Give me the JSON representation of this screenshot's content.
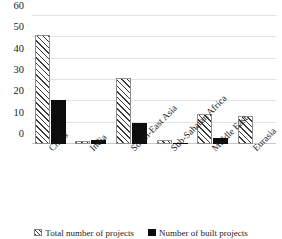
{
  "chart_data": {
    "type": "bar",
    "title": "",
    "subtitle": "",
    "xlabel": "",
    "ylabel": "",
    "ylim": [
      0,
      60
    ],
    "yticks": [
      0,
      10,
      20,
      30,
      40,
      50,
      60
    ],
    "grid": true,
    "legend_position": "bottom",
    "categories": [
      "China",
      "India",
      "South-East Asia",
      "Sub-Saharan Africa",
      "Middle East",
      "Eurasia"
    ],
    "series": [
      {
        "name": "Total number of projects",
        "pattern": "diagonal-hatch",
        "color": "#ffffff",
        "values": [
          51,
          1.5,
          31,
          2,
          14,
          13
        ]
      },
      {
        "name": "Number of built projects",
        "pattern": "solid",
        "color": "#0d0d0d",
        "values": [
          20.5,
          2,
          10,
          0.5,
          3,
          0
        ]
      }
    ]
  },
  "legend": {
    "items": [
      {
        "label": "Total number of projects",
        "swatch": "hatch-swatch"
      },
      {
        "label": "Number of built projects",
        "swatch": "solid-swatch"
      }
    ]
  }
}
